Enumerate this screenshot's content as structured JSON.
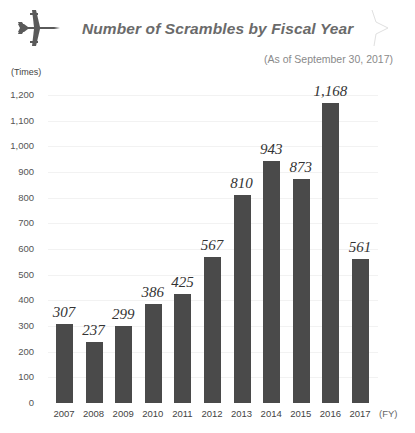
{
  "header": {
    "title": "Number of Scrambles by Fiscal Year",
    "as_of": "(As of September 30, 2017)",
    "icon": "fighter-jet-icon"
  },
  "chart_data": {
    "type": "bar",
    "title": "Number of Scrambles by Fiscal Year",
    "subtitle": "(As of September 30, 2017)",
    "xlabel": "(FY)",
    "ylabel": "(Times)",
    "ylim": [
      0,
      1200
    ],
    "yticks": [
      "0",
      "100",
      "200",
      "300",
      "400",
      "500",
      "600",
      "700",
      "800",
      "900",
      "1,000",
      "1,100",
      "1,200"
    ],
    "categories": [
      "2007",
      "2008",
      "2009",
      "2010",
      "2011",
      "2012",
      "2013",
      "2014",
      "2015",
      "2016",
      "2017"
    ],
    "values": [
      307,
      237,
      299,
      386,
      425,
      567,
      810,
      943,
      873,
      1168,
      561
    ],
    "value_labels": [
      "307",
      "237",
      "299",
      "386",
      "425",
      "567",
      "810",
      "943",
      "873",
      "1,168",
      "561"
    ],
    "grid": true,
    "legend": null,
    "bar_color": "#4a4a4a"
  }
}
